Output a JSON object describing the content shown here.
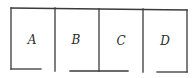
{
  "diagram": {
    "type": "rooms-layout",
    "rooms": [
      {
        "id": "A",
        "label": "A"
      },
      {
        "id": "B",
        "label": "B"
      },
      {
        "id": "C",
        "label": "C"
      },
      {
        "id": "D",
        "label": "D"
      }
    ],
    "colors": {
      "line": "#3a3a3a",
      "text": "#2a2a2a",
      "background": "#ffffff"
    }
  }
}
